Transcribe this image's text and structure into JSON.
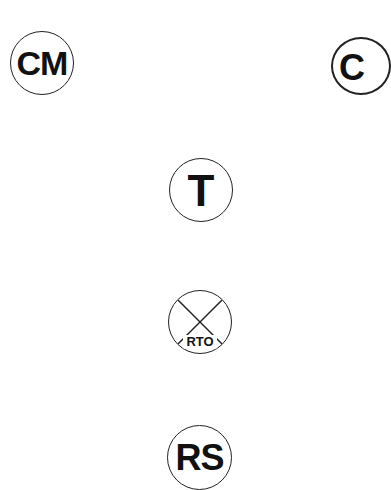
{
  "symbols": [
    {
      "id": "cm",
      "label": "CM",
      "cx": 42,
      "cy": 63,
      "r": 32
    },
    {
      "id": "partial",
      "label": "C",
      "cx": 362,
      "cy": 66,
      "r": 30
    },
    {
      "id": "t",
      "label": "T",
      "cx": 201,
      "cy": 190,
      "r": 32
    },
    {
      "id": "rto",
      "label": "RTO",
      "cx": 200,
      "cy": 322,
      "r": 32,
      "crossed": true
    },
    {
      "id": "rs",
      "label": "RS",
      "cx": 199,
      "cy": 457,
      "r": 32
    }
  ],
  "colors": {
    "stroke": "#222222",
    "text": "#111111",
    "background": "#ffffff"
  }
}
